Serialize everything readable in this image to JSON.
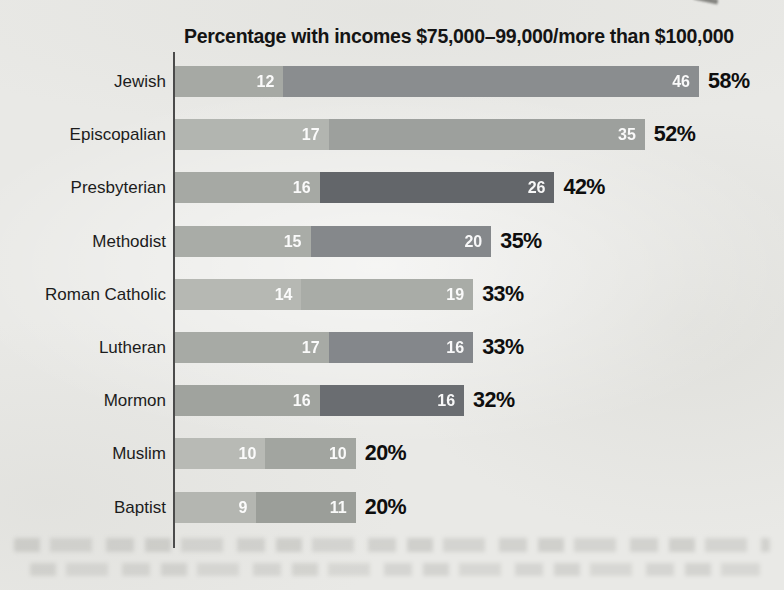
{
  "page": {
    "background_color": "#e9e9e6",
    "description_visible_elements": "scanned book page with horizontal stacked bar chart and blurred ghost text lines at bottom"
  },
  "chart_data": {
    "type": "bar",
    "orientation": "horizontal",
    "stacked": true,
    "title": "Percentage with incomes $75,000–99,000/more than $100,000",
    "categories": [
      "Jewish",
      "Episcopalian",
      "Presbyterian",
      "Methodist",
      "Roman Catholic",
      "Lutheran",
      "Mormon",
      "Muslim",
      "Baptist"
    ],
    "series": [
      {
        "name": "$75,000–99,000",
        "values": [
          12,
          17,
          16,
          15,
          14,
          17,
          16,
          10,
          9
        ]
      },
      {
        "name": "more than $100,000",
        "values": [
          46,
          35,
          26,
          20,
          19,
          16,
          16,
          10,
          11
        ]
      }
    ],
    "totals": [
      "58%",
      "52%",
      "42%",
      "35%",
      "33%",
      "33%",
      "32%",
      "20%",
      "20%"
    ],
    "xlim": [
      0,
      58
    ],
    "grid": false,
    "legend": "none (series encoded in title)",
    "axis_color": "#4b4b4b",
    "value_label_color": "#ffffff",
    "total_label_color": "#0e0e0e",
    "segment_colors": [
      [
        "#a6a9a4",
        "#8a8d8f"
      ],
      [
        "#b2b5b0",
        "#9da09d"
      ],
      [
        "#a6a9a4",
        "#63666a"
      ],
      [
        "#a9aca7",
        "#85888b"
      ],
      [
        "#b6b8b3",
        "#a9aca7"
      ],
      [
        "#a7aaa5",
        "#84878b"
      ],
      [
        "#a0a39e",
        "#6a6d71"
      ],
      [
        "#b8bab5",
        "#a2a5a0"
      ],
      [
        "#b4b6b1",
        "#9b9e99"
      ]
    ]
  }
}
